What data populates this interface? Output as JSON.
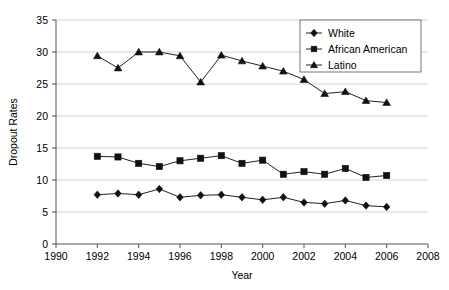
{
  "chart_data": {
    "type": "line",
    "title": "",
    "xlabel": "Year",
    "ylabel": "Dropout Rates",
    "xlim": [
      1990,
      2008
    ],
    "ylim": [
      0,
      35
    ],
    "xticks": [
      1990,
      1992,
      1994,
      1996,
      1998,
      2000,
      2002,
      2004,
      2006,
      2008
    ],
    "yticks": [
      0,
      5,
      10,
      15,
      20,
      25,
      30,
      35
    ],
    "grid": "horizontal",
    "legend_position": "top-right",
    "x": [
      1992,
      1993,
      1994,
      1995,
      1996,
      1997,
      1998,
      1999,
      2000,
      2001,
      2002,
      2003,
      2004,
      2005,
      2006
    ],
    "series": [
      {
        "name": "White",
        "marker": "diamond",
        "color": "#111111",
        "values": [
          7.7,
          7.9,
          7.7,
          8.6,
          7.3,
          7.6,
          7.7,
          7.3,
          6.9,
          7.3,
          6.5,
          6.3,
          6.8,
          6.0,
          5.8
        ]
      },
      {
        "name": "African American",
        "marker": "square",
        "color": "#111111",
        "values": [
          13.7,
          13.6,
          12.6,
          12.1,
          13.0,
          13.4,
          13.8,
          12.6,
          13.1,
          10.9,
          11.3,
          10.9,
          11.8,
          10.4,
          10.7
        ]
      },
      {
        "name": "Latino",
        "marker": "triangle",
        "color": "#111111",
        "values": [
          29.4,
          27.5,
          30.0,
          30.0,
          29.4,
          25.3,
          29.5,
          28.6,
          27.8,
          27.0,
          25.7,
          23.5,
          23.8,
          22.4,
          22.1
        ]
      }
    ]
  },
  "axis": {
    "x_title": "Year",
    "y_title": "Dropout Rates",
    "x_tick_labels": [
      "1990",
      "1992",
      "1994",
      "1996",
      "1998",
      "2000",
      "2002",
      "2004",
      "2006",
      "2008"
    ],
    "y_tick_labels": [
      "0",
      "5",
      "10",
      "15",
      "20",
      "25",
      "30",
      "35"
    ]
  },
  "legend": {
    "items": [
      {
        "label": "White",
        "marker": "diamond-icon"
      },
      {
        "label": "African American",
        "marker": "square-icon"
      },
      {
        "label": "Latino",
        "marker": "triangle-icon"
      }
    ]
  }
}
